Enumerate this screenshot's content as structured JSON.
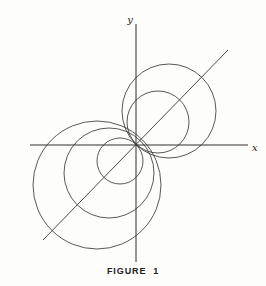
{
  "figure": {
    "caption": "FIGURE  1",
    "background_color": "#fdfdfc",
    "line_color": "#3a3a3a",
    "axis_color": "#2e2e2e",
    "axis_labels": {
      "x": "x",
      "y": "y"
    }
  },
  "chart_data": {
    "type": "scatter",
    "title": "FIGURE 1",
    "xlabel": "x",
    "ylabel": "y",
    "grid": false,
    "legend": false,
    "origin_px": {
      "x": 136,
      "y": 145
    },
    "axes": {
      "x_axis_px": {
        "x1": 30,
        "y1": 145,
        "x2": 248,
        "y2": 145
      },
      "y_axis_px": {
        "x1": 136,
        "y1": 24,
        "x2": 136,
        "y2": 262
      },
      "x_label_px": {
        "x": 252,
        "y": 148
      },
      "y_label_px": {
        "x": 130,
        "y": 20
      }
    },
    "tangent_line": {
      "name": "y = x",
      "slope": 1,
      "start_px": {
        "x": 43,
        "y": 240
      },
      "end_px": {
        "x": 228,
        "y": 50
      }
    },
    "circles_px": [
      {
        "name": "upper-right-large",
        "cx": 169,
        "cy": 111,
        "r": 47
      },
      {
        "name": "upper-right-small",
        "cx": 158,
        "cy": 122,
        "r": 31
      },
      {
        "name": "lower-left-large",
        "cx": 97,
        "cy": 185,
        "r": 64
      },
      {
        "name": "lower-left-medium",
        "cx": 109,
        "cy": 173,
        "r": 45
      },
      {
        "name": "lower-left-small",
        "cx": 120,
        "cy": 161,
        "r": 23
      }
    ],
    "circle_count": 5
  }
}
